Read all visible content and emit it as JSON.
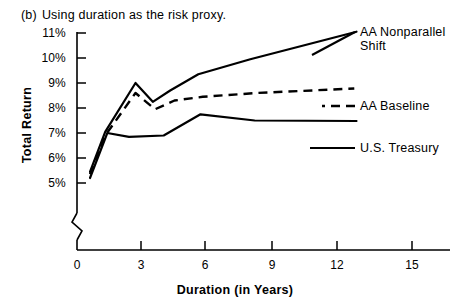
{
  "caption": {
    "label": "(b)",
    "text": "Using duration as the risk proxy."
  },
  "chart_data": {
    "type": "line",
    "title": "Using duration as the risk proxy.",
    "xlabel": "Duration (in Years)",
    "ylabel": "Total Return",
    "xlim": [
      0,
      16.5
    ],
    "ylim": [
      4.6,
      11.3
    ],
    "y_axis_break": true,
    "grid": false,
    "legend_position": "right-inline",
    "xticks": [
      0,
      3,
      6,
      9,
      12,
      15
    ],
    "xtick_labels": [
      "0",
      "3",
      "6",
      "9",
      "12",
      "15"
    ],
    "yticks": [
      5,
      6,
      7,
      8,
      9,
      10,
      11
    ],
    "ytick_labels": [
      "5%",
      "6%",
      "7%",
      "8%",
      "9%",
      "10%",
      "11%"
    ],
    "series": [
      {
        "name": "AA Nonparallel Shift",
        "style": "solid",
        "color": "#000000",
        "x": [
          0.6,
          1.3,
          2.7,
          3.5,
          4.3,
          5.6,
          8.0,
          12.9
        ],
        "y": [
          5.45,
          7.05,
          9.0,
          8.25,
          8.7,
          9.35,
          9.95,
          11.05
        ]
      },
      {
        "name": "AA Baseline",
        "style": "dashed",
        "color": "#000000",
        "x": [
          0.6,
          1.3,
          2.7,
          3.6,
          4.5,
          5.8,
          8.3,
          12.8
        ],
        "y": [
          5.35,
          6.9,
          8.6,
          7.95,
          8.3,
          8.45,
          8.6,
          8.78
        ]
      },
      {
        "name": "U.S. Treasury",
        "style": "solid",
        "color": "#000000",
        "x": [
          0.6,
          1.4,
          2.4,
          4.0,
          5.7,
          8.2,
          12.9
        ],
        "y": [
          5.2,
          7.0,
          6.85,
          6.9,
          7.75,
          7.5,
          7.48
        ]
      }
    ],
    "annotations": [
      {
        "text": "AA Nonparallel",
        "series": "AA Nonparallel Shift"
      },
      {
        "text": "Shift",
        "series": "AA Nonparallel Shift"
      },
      {
        "text": "AA Baseline",
        "series": "AA Baseline"
      },
      {
        "text": "U.S. Treasury",
        "series": "U.S. Treasury"
      }
    ]
  },
  "labels": {
    "nonparallel_line1": "AA Nonparallel",
    "nonparallel_line2": "Shift",
    "baseline": "AA Baseline",
    "treasury": "U.S. Treasury"
  }
}
